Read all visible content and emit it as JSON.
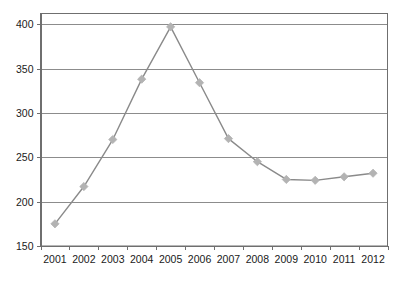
{
  "chart_data": {
    "type": "line",
    "title": "",
    "subtitle": "",
    "xlabel": "",
    "ylabel": "",
    "categories": [
      "2001",
      "2002",
      "2003",
      "2004",
      "2005",
      "2006",
      "2007",
      "2008",
      "2009",
      "2010",
      "2011",
      "2012"
    ],
    "values": [
      175,
      217,
      270,
      338,
      397,
      334,
      271,
      245,
      225,
      224,
      228,
      232
    ],
    "series": [
      {
        "name": "series-1",
        "values": [
          175,
          217,
          270,
          338,
          397,
          334,
          271,
          245,
          225,
          224,
          228,
          232
        ]
      }
    ],
    "ylim": [
      150,
      412
    ],
    "y_ticks": [
      150,
      200,
      250,
      300,
      350,
      400
    ],
    "y_tick_labels": [
      "150",
      "200",
      "250",
      "300",
      "350",
      "400"
    ],
    "x_tick_labels": [
      "2001",
      "2002",
      "2003",
      "2004",
      "2005",
      "2006",
      "2007",
      "2008",
      "2009",
      "2010",
      "2011",
      "2012"
    ],
    "grid": true,
    "grid_axis": "y",
    "legend": false,
    "legend_position": "none",
    "marker": "diamond",
    "colors": {
      "line": "#8a8a8a",
      "marker": "#b3b3b3",
      "grid": "#8c8c8c",
      "axis": "#6f6f6f",
      "text": "#1a1a1a",
      "background": "#ffffff"
    }
  }
}
